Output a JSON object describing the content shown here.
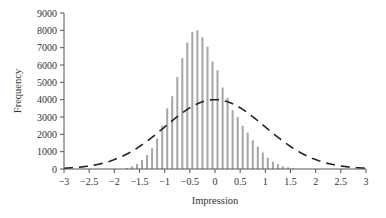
{
  "chart_data": {
    "type": "bar",
    "title": "",
    "xlabel": "Impression",
    "ylabel": "Frequency",
    "xlim": [
      -3,
      3
    ],
    "ylim": [
      0,
      9000
    ],
    "xticks": [
      -3,
      -2.5,
      -2,
      -1.5,
      -1,
      -0.5,
      0,
      0.5,
      1,
      1.5,
      2,
      2.5,
      3
    ],
    "xtick_labels": [
      "−3",
      "−2.5",
      "−2",
      "−1.5",
      "−1",
      "−0.5",
      "0",
      "0.5",
      "1",
      "1.5",
      "2",
      "2.5",
      "3"
    ],
    "yticks": [
      0,
      1000,
      2000,
      3000,
      4000,
      5000,
      6000,
      7000,
      8000,
      9000
    ],
    "grid": false,
    "legend": null,
    "series": [
      {
        "name": "Histogram",
        "type": "bar",
        "color": "#a6a6a6",
        "x": [
          -1.75,
          -1.65,
          -1.55,
          -1.45,
          -1.35,
          -1.25,
          -1.15,
          -1.05,
          -0.95,
          -0.85,
          -0.75,
          -0.65,
          -0.55,
          -0.45,
          -0.35,
          -0.25,
          -0.15,
          -0.05,
          0.05,
          0.15,
          0.25,
          0.35,
          0.45,
          0.55,
          0.65,
          0.75,
          0.85,
          0.95,
          1.05,
          1.15,
          1.25,
          1.35,
          1.45,
          1.55
        ],
        "values": [
          60,
          150,
          280,
          520,
          800,
          1200,
          1750,
          2500,
          3500,
          4200,
          5300,
          6400,
          7300,
          7900,
          8000,
          7600,
          7050,
          6200,
          5700,
          4700,
          4100,
          3400,
          3000,
          2500,
          2100,
          1650,
          1300,
          950,
          650,
          420,
          280,
          160,
          100,
          50
        ]
      },
      {
        "name": "Normal curve",
        "type": "line",
        "style": "dashed",
        "color": "#222222",
        "mean": 0,
        "sd": 1,
        "peak": 4000
      }
    ]
  }
}
